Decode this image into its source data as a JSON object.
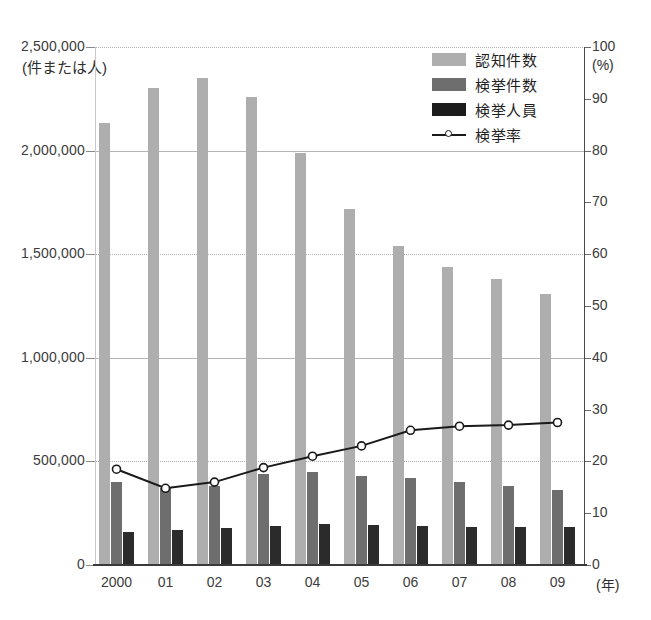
{
  "chart_data": {
    "type": "bar",
    "title": "",
    "xlabel": "(年)",
    "ylabel": "(件または人)",
    "ylabel_right": "(%)",
    "categories": [
      "2000",
      "01",
      "02",
      "03",
      "04",
      "05",
      "06",
      "07",
      "08",
      "09"
    ],
    "ylim": [
      0,
      2500000
    ],
    "ylim_right": [
      0,
      100
    ],
    "yticks": [
      "0",
      "500,000",
      "1,000,000",
      "1,500,000",
      "2,000,000",
      "2,500,000"
    ],
    "yticks_right": [
      "0",
      "10",
      "20",
      "30",
      "40",
      "50",
      "60",
      "70",
      "80",
      "90",
      "100"
    ],
    "grid": true,
    "legend_position": "top-right",
    "series": [
      {
        "name": "認知件数",
        "kind": "bar",
        "color": "#aeaeae",
        "axis": "left",
        "values": [
          2131000,
          2300000,
          2350000,
          2260000,
          1990000,
          1720000,
          1540000,
          1440000,
          1380000,
          1310000
        ]
      },
      {
        "name": "検挙件数",
        "kind": "bar",
        "color": "#6e6e6e",
        "axis": "left",
        "values": [
          400000,
          370000,
          380000,
          440000,
          450000,
          430000,
          420000,
          400000,
          380000,
          360000
        ]
      },
      {
        "name": "検挙人員",
        "kind": "bar",
        "color": "#2b2b2b",
        "axis": "left",
        "values": [
          160000,
          170000,
          180000,
          190000,
          200000,
          195000,
          190000,
          185000,
          185000,
          185000
        ]
      },
      {
        "name": "検挙率",
        "kind": "line",
        "color": "#1a1a1a",
        "axis": "right",
        "values": [
          18.5,
          14.8,
          16.0,
          18.8,
          21.0,
          23.0,
          26.0,
          26.8,
          27.0,
          27.5
        ]
      }
    ]
  },
  "axis": {
    "left_unit": "(件または人)",
    "right_unit": "(%)",
    "x_unit": "(年)"
  },
  "legend": {
    "items": [
      {
        "label": "認知件数",
        "icon": "swatch-light-gray"
      },
      {
        "label": "検挙件数",
        "icon": "swatch-medium-gray"
      },
      {
        "label": "検挙人員",
        "icon": "swatch-black"
      },
      {
        "label": "検挙率",
        "icon": "line-marker"
      }
    ]
  }
}
